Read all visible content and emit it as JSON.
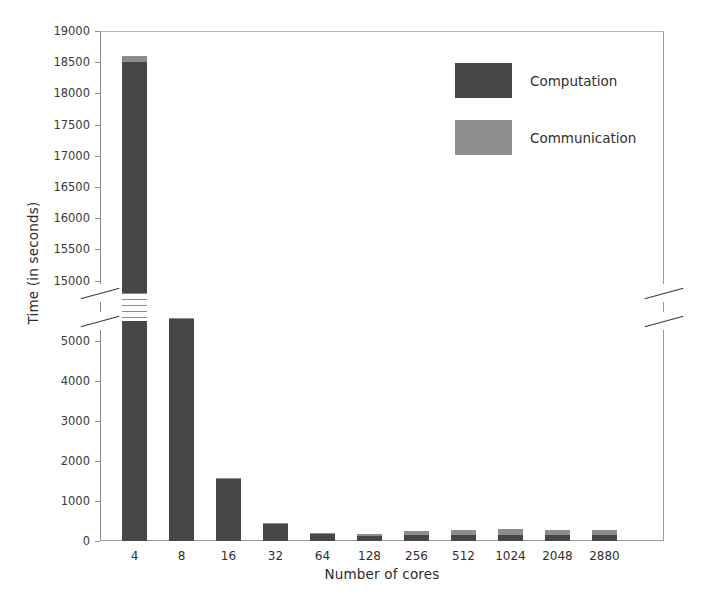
{
  "chart_data": {
    "type": "bar",
    "title": "",
    "subtitle": "",
    "xlabel": "Number of cores",
    "ylabel": "Time (in seconds)",
    "stacked": true,
    "grid": false,
    "legend_position": "upper-right",
    "axis_break": {
      "present": true,
      "lower_range": [
        0,
        5500
      ],
      "upper_range": [
        14800,
        19000
      ],
      "note": "y-axis broken between 5500 and 14800"
    },
    "categories": [
      "4",
      "8",
      "16",
      "32",
      "64",
      "128",
      "256",
      "512",
      "1024",
      "2048",
      "2880"
    ],
    "series": [
      {
        "name": "Computation",
        "color": "#474747",
        "values": [
          18500,
          5550,
          1560,
          440,
          170,
          120,
          150,
          140,
          150,
          140,
          140
        ]
      },
      {
        "name": "Communication",
        "color": "#8d8d8d",
        "values": [
          100,
          30,
          20,
          20,
          30,
          50,
          110,
          130,
          140,
          140,
          140
        ]
      }
    ],
    "totals": [
      18600,
      5580,
      1580,
      460,
      200,
      170,
      260,
      270,
      290,
      280,
      280
    ],
    "yticks": [
      0,
      1000,
      2000,
      3000,
      4000,
      5000,
      15000,
      15500,
      16000,
      16500,
      17000,
      17500,
      18000,
      18500,
      19000
    ],
    "ytick_labels": [
      "0",
      "1000",
      "2000",
      "3000",
      "4000",
      "5000",
      "15000",
      "15500",
      "16000",
      "16500",
      "17000",
      "17500",
      "18000",
      "18500",
      "19000"
    ],
    "ylim_lower": [
      0,
      5500
    ],
    "ylim_upper": [
      14800,
      19000
    ]
  },
  "legend": {
    "items": [
      {
        "label": "Computation",
        "color": "#474747"
      },
      {
        "label": "Communication",
        "color": "#8d8d8d"
      }
    ]
  },
  "axes": {
    "xlabel": "Number of cores",
    "ylabel": "Time (in seconds)"
  }
}
